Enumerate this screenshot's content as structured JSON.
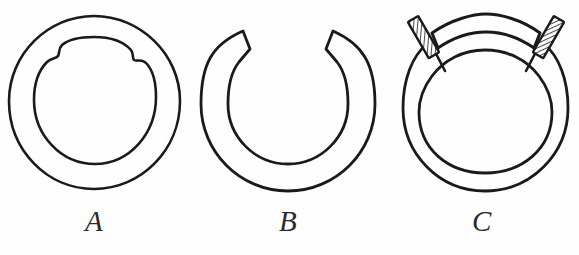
{
  "figure": {
    "background_color": "#fefefe",
    "ink_color": "#1a1a1a",
    "panel_count": 3,
    "panels": [
      {
        "id": "a",
        "caption": "A",
        "description": "Closed intact ring: outer circle with irregular inner contour showing joined ends",
        "state": "closed",
        "center": {
          "x": 94,
          "y": 102
        },
        "outer_radius": 86,
        "inner_radius": 62,
        "has_gap": false,
        "gap_degrees": 0,
        "fastener_count": 0
      },
      {
        "id": "b",
        "caption": "B",
        "description": "Open C-shaped ring with wedge gap at top and beveled tips",
        "state": "open",
        "center": {
          "x": 288,
          "y": 104
        },
        "outer_radius": 87,
        "inner_radius": 60,
        "has_gap": true,
        "gap_degrees": 58,
        "fastener_count": 0
      },
      {
        "id": "c",
        "caption": "C",
        "description": "Ring repaired with an arched bridging plate secured by two hatched fasteners",
        "state": "repaired",
        "center": {
          "x": 485,
          "y": 110
        },
        "outer_radius": 83,
        "inner_radius": 60,
        "has_gap": true,
        "gap_degrees": 66,
        "fastener_count": 2,
        "fasteners": [
          {
            "label": "left-fastener",
            "x": 427,
            "y": 37,
            "angle": -28,
            "hatched": true
          },
          {
            "label": "right-fastener",
            "x": 548,
            "y": 37,
            "angle": 28,
            "hatched": true
          }
        ],
        "plate": {
          "label": "bridging-plate",
          "hatched": false
        }
      }
    ]
  }
}
